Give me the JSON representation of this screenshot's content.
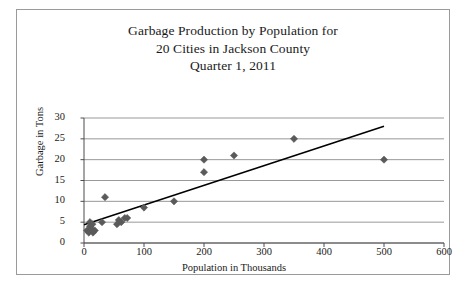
{
  "title": {
    "line1": "Garbage Production by Population for",
    "line2": "20 Cities in Jackson County",
    "line3": "Quarter 1, 2011"
  },
  "colors": {
    "marker": "#5a5a5a",
    "trendline": "#000000",
    "gridline": "#8c8c8c",
    "axis": "#4d4d4d",
    "border": "#9a9a9a",
    "background": "#ffffff",
    "text": "#1a1a1a"
  },
  "chart_data": {
    "type": "scatter",
    "title": "Garbage Production by Population for 20 Cities in Jackson County Quarter 1, 2011",
    "xlabel": "Population in Thousands",
    "ylabel": "Garbage in Tons",
    "xlim": [
      0,
      600
    ],
    "ylim": [
      0,
      30
    ],
    "xticks": [
      0,
      100,
      200,
      300,
      400,
      500,
      600
    ],
    "yticks": [
      0,
      5,
      10,
      15,
      20,
      25,
      30
    ],
    "grid": "horizontal",
    "legend": "none",
    "marker_shape": "diamond",
    "points": [
      {
        "x": 5,
        "y": 3
      },
      {
        "x": 8,
        "y": 2.5
      },
      {
        "x": 10,
        "y": 4
      },
      {
        "x": 10,
        "y": 5
      },
      {
        "x": 12,
        "y": 3.5
      },
      {
        "x": 14,
        "y": 4.5
      },
      {
        "x": 15,
        "y": 2.5
      },
      {
        "x": 18,
        "y": 3
      },
      {
        "x": 30,
        "y": 5
      },
      {
        "x": 35,
        "y": 11
      },
      {
        "x": 55,
        "y": 4.5
      },
      {
        "x": 58,
        "y": 5.5
      },
      {
        "x": 62,
        "y": 5
      },
      {
        "x": 68,
        "y": 6
      },
      {
        "x": 72,
        "y": 6
      },
      {
        "x": 100,
        "y": 8.5
      },
      {
        "x": 150,
        "y": 10
      },
      {
        "x": 200,
        "y": 20
      },
      {
        "x": 200,
        "y": 17
      },
      {
        "x": 250,
        "y": 21
      },
      {
        "x": 350,
        "y": 25
      },
      {
        "x": 500,
        "y": 20
      }
    ],
    "trendline": {
      "x0": 0,
      "y0": 4.4,
      "x1": 500,
      "y1": 28.0
    }
  }
}
